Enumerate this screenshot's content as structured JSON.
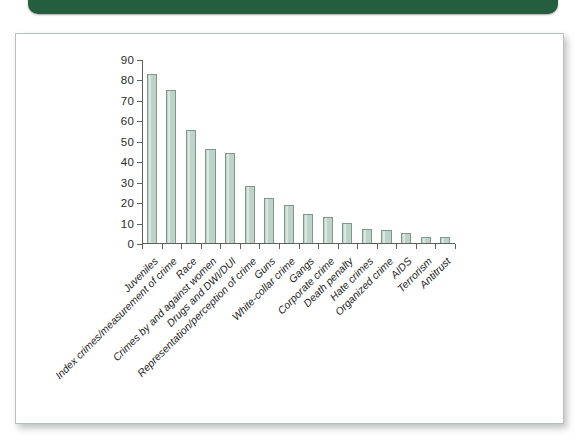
{
  "page": {
    "banner_color": "#255e3e",
    "card_border_color": "#b9bfbd",
    "background_color": "#ffffff"
  },
  "chart_data": {
    "type": "bar",
    "title": "",
    "subtitle": "",
    "xlabel": "",
    "ylabel": "",
    "ylim": [
      0,
      90
    ],
    "ytick_step": 10,
    "yticks": [
      0,
      10,
      20,
      30,
      40,
      50,
      60,
      70,
      80,
      90
    ],
    "ytick_labels": [
      "0",
      "10",
      "20",
      "30",
      "40",
      "50",
      "60",
      "70",
      "80",
      "90"
    ],
    "grid": false,
    "legend": null,
    "bar_fill_color": "#bdd2c8",
    "bar_edge_color": "#7f988c",
    "axis_color": "#5d625f",
    "categories": [
      "Juveniles",
      "Index crimes/measurement of crime",
      "Race",
      "Crimes by and against women",
      "Drugs and DWI/DUI",
      "Representation/perception of crime",
      "Guns",
      "White-collar crime",
      "Gangs",
      "Corporate crime",
      "Death penalty",
      "Hate crimes",
      "Organized crime",
      "AIDS",
      "Terrorism",
      "Antitrust"
    ],
    "values": [
      82.5,
      75,
      55.5,
      46,
      44,
      28,
      22,
      18.5,
      14,
      12.5,
      10,
      6.8,
      6.4,
      5,
      3,
      3
    ]
  }
}
